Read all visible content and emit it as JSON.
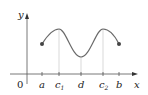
{
  "diagram": {
    "axes": {
      "x_label": "x",
      "y_label": "y",
      "origin_label": "0"
    },
    "ticks": [
      {
        "label": "a",
        "sub": "",
        "x": 42
      },
      {
        "label": "c",
        "sub": "1",
        "x": 59
      },
      {
        "label": "d",
        "sub": "",
        "x": 81
      },
      {
        "label": "c",
        "sub": "2",
        "x": 103
      },
      {
        "label": "b",
        "sub": "",
        "x": 119
      }
    ],
    "curve": {
      "description": "Continuous function on [a,b] with local maxima at c1 and c2 and a local minimum at d",
      "color": "#666666",
      "endpoint_color": "#444444"
    },
    "guide_line_color": "#cccccc"
  }
}
